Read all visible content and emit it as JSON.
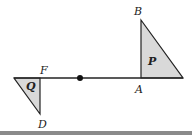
{
  "diagram": {
    "type": "geometry-reflection",
    "line": {
      "x1": 14,
      "y1": 78,
      "x2": 183,
      "y2": 78,
      "color": "#222222"
    },
    "center_point": {
      "x": 80,
      "y": 78,
      "r": 3,
      "color": "#111111"
    },
    "triangles": [
      {
        "name": "P",
        "points": "141,20 141,78 183,78",
        "fill": "#d9d9d9",
        "label": "P",
        "label_x": 148,
        "label_y": 65
      },
      {
        "name": "Q",
        "points": "14,78 40,78 40,114",
        "fill": "#d9d9d9",
        "label": "Q",
        "label_x": 26,
        "label_y": 90
      }
    ],
    "vertex_labels": [
      {
        "text": "B",
        "x": 134,
        "y": 15
      },
      {
        "text": "A",
        "x": 135,
        "y": 93
      },
      {
        "text": "F",
        "x": 40,
        "y": 74
      },
      {
        "text": "D",
        "x": 38,
        "y": 128
      }
    ],
    "bottom_bar_color": "#8a8a8a"
  }
}
